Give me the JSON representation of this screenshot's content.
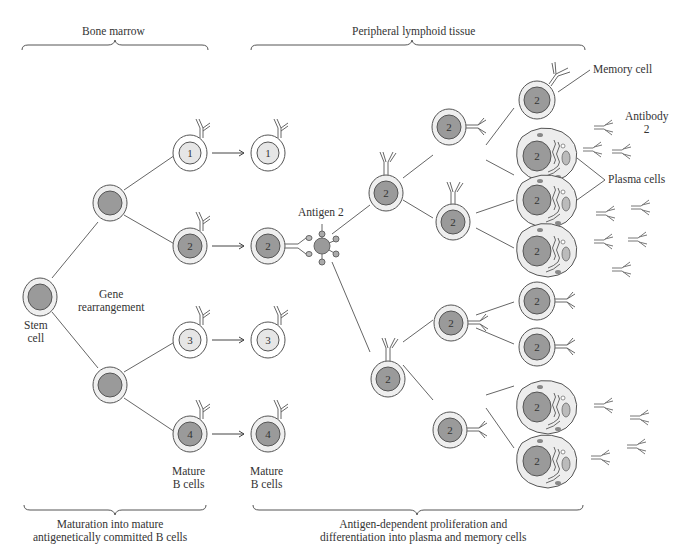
{
  "regions": {
    "bone_marrow": "Bone marrow",
    "peripheral": "Peripheral lymphoid tissue"
  },
  "labels": {
    "stem_cell_line1": "Stem",
    "stem_cell_line2": "cell",
    "gene_line1": "Gene",
    "gene_line2": "rearrangement",
    "mature1_line1": "Mature",
    "mature1_line2": "B cells",
    "mature2_line1": "Mature",
    "mature2_line2": "B cells",
    "antigen": "Antigen 2",
    "memory_cell": "Memory cell",
    "antibody_line1": "Antibody",
    "antibody_line2": "2",
    "plasma_cells": "Plasma cells"
  },
  "captions": {
    "left_line1": "Maturation into mature",
    "left_line2": "antigenetically committed B cells",
    "right_line1": "Antigen-dependent proliferation and",
    "right_line2": "differentiation into plasma and memory cells"
  },
  "cells": {
    "bm_mature": [
      "1",
      "2",
      "3",
      "4"
    ],
    "periph_mature": [
      "1",
      "2",
      "3",
      "4"
    ],
    "clone_number": "2"
  },
  "colors": {
    "nucleus_dark": "#9a9a9a",
    "nucleus_light": "#e6e6e6",
    "cytoplasm": "#efefef",
    "line": "#555555"
  }
}
